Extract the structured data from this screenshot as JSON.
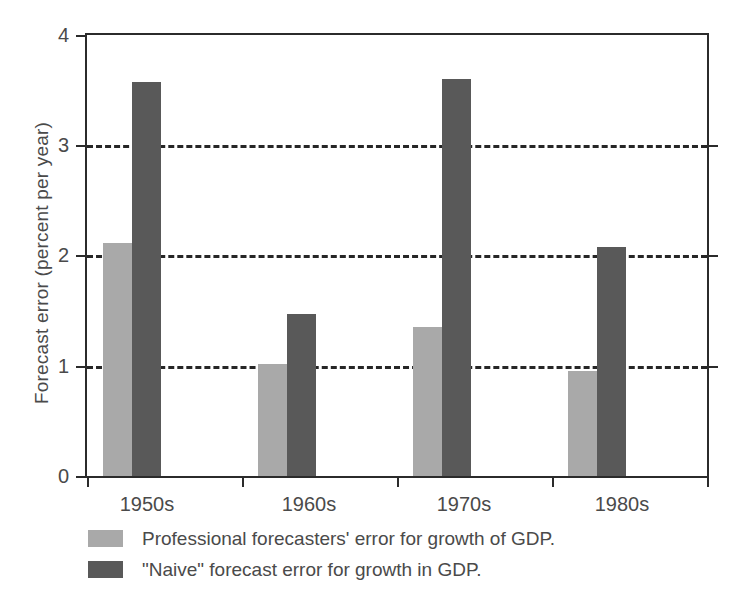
{
  "chart_data": {
    "type": "bar",
    "title": "",
    "xlabel": "",
    "ylabel": "Forecast error (percent per year)",
    "categories": [
      "1950s",
      "1960s",
      "1970s",
      "1980s"
    ],
    "series": [
      {
        "name": "Professional forecasters' error for growth of GDP.",
        "color": "#a9a9a9",
        "values": [
          2.11,
          1.02,
          1.35,
          0.95
        ]
      },
      {
        "name": "\"Naive\" forecast error for growth in GDP.",
        "color": "#595959",
        "values": [
          3.57,
          1.47,
          3.6,
          2.08
        ]
      }
    ],
    "ylim": [
      0,
      4
    ],
    "yticks": [
      0,
      1,
      2,
      3,
      4
    ],
    "ytick_labels": [
      "0",
      "1",
      "2",
      "3",
      "4"
    ],
    "grid": "horizontal-dashed",
    "legend_position": "below-axes-left"
  },
  "axes": {
    "y_title": "Forecast error (percent per year)",
    "y_ticks": [
      {
        "value": 4,
        "label": "4"
      },
      {
        "value": 3,
        "label": "3"
      },
      {
        "value": 2,
        "label": "2"
      },
      {
        "value": 1,
        "label": "1"
      },
      {
        "value": 0,
        "label": "0"
      }
    ],
    "x_ticks": [
      {
        "label": "1950s"
      },
      {
        "label": "1960s"
      },
      {
        "label": "1970s"
      },
      {
        "label": "1980s"
      }
    ]
  },
  "legend": {
    "items": [
      {
        "label": "Professional forecasters' error for growth of GDP.",
        "color": "#a9a9a9"
      },
      {
        "label": "\"Naive\" forecast error for growth in GDP.",
        "color": "#595959"
      }
    ]
  }
}
